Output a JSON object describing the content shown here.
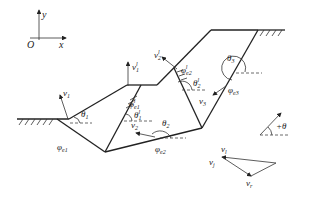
{
  "diagram": {
    "title": "",
    "axes": {
      "y_label": "y",
      "x_label": "x",
      "origin_label": "O"
    },
    "labels": {
      "v1": "v",
      "v1_sub": "1",
      "theta1": "θ",
      "theta1_sub": "1",
      "phi_e1": "φ",
      "phi_e1_sub": "e1",
      "v1l": "v",
      "v1l_sub": "1",
      "v1l_sup": "l",
      "phi_e1l": "φ",
      "phi_e1l_sub": "e1",
      "phi_e1l_sup": "l",
      "theta1l": "θ",
      "theta1l_sub": "1",
      "theta1l_sup": "l",
      "v2l": "v",
      "v2l_sub": "2",
      "v2l_sup": "l",
      "phi_e2l": "φ",
      "phi_e2l_sub": "e2",
      "phi_e2l_sup": "l",
      "theta2l": "θ",
      "theta2l_sub": "2",
      "theta2l_sup": "l",
      "theta3": "θ",
      "theta3_sub": "3",
      "v3": "v",
      "v3_sub": "3",
      "phi_e3": "φ",
      "phi_e3_sub": "e3",
      "v2": "v",
      "v2_sub": "2",
      "theta2": "θ",
      "theta2_sub": "2",
      "phi_e2": "φ",
      "phi_e2_sub": "e2",
      "plus_theta": "+θ",
      "vl": "v",
      "vl_sub": "l",
      "vj": "v",
      "vj_sub": "j",
      "vr": "v",
      "vr_sub": "r"
    }
  }
}
